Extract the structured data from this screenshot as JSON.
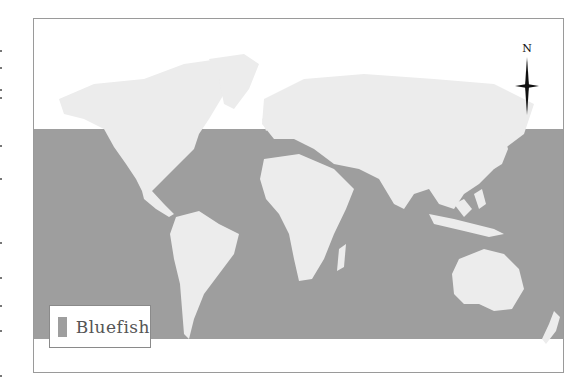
{
  "map": {
    "title": "Bluefish distribution",
    "ocean_band_color": "#9e9e9e",
    "land_color": "#ececec",
    "background_color": "#ffffff",
    "compass": {
      "label": "N"
    },
    "legend": {
      "items": [
        {
          "label": "Bluefish",
          "color": "#9e9e9e"
        }
      ]
    }
  }
}
